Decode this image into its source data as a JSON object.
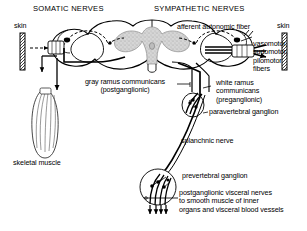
{
  "figure": {
    "type": "anatomical-diagram",
    "background_color": "#ffffff",
    "line_color": "#000000",
    "gray_matter_color": "#c9c9c9"
  },
  "headings": {
    "somatic": "SOMATIC NERVES",
    "sympathetic": "SYMPATHETIC NERVES"
  },
  "labels": {
    "skin_left": "skin",
    "skin_right": "skin",
    "afferent_autonomic_fiber": "afferent autonomic fiber",
    "vasomotor_fibers": "vasomotor,\nsudomotor,\npilomotor\nfibers",
    "gray_ramus": "gray ramus communicans\n(postganglionic)",
    "white_ramus": "white ramus\ncommunicans\n(preganglionic)",
    "paravertebral_ganglion": "paravertebral ganglion",
    "splanchnic_nerve": "splanchnic nerve",
    "prevertebral_ganglion": "prevertebral ganglion",
    "visceral_nerves": "postganglionic visceral nerves\nto smooth muscle of inner\norgans and visceral blood vessels",
    "skeletal_muscle": "skeletal muscle"
  },
  "structures": [
    {
      "name": "spinal-cord-cross-section",
      "description": "butterfly-shaped gray matter with surrounding white matter"
    },
    {
      "name": "dorsal-root-ganglion-left",
      "description": "sensory ganglion on left dorsal root"
    },
    {
      "name": "dorsal-root-ganglion-right",
      "description": "sensory ganglion on right dorsal root"
    },
    {
      "name": "skeletal-muscle",
      "description": "striated spindle-shaped muscle belly"
    },
    {
      "name": "paravertebral-ganglion",
      "description": "oval sympathetic chain ganglion with synapses"
    },
    {
      "name": "prevertebral-ganglion",
      "description": "circular collateral ganglion with branching fibers"
    },
    {
      "name": "skin-bar-left",
      "description": "hatched vertical bar representing skin"
    },
    {
      "name": "skin-bar-right",
      "description": "hatched vertical bar representing skin"
    }
  ]
}
